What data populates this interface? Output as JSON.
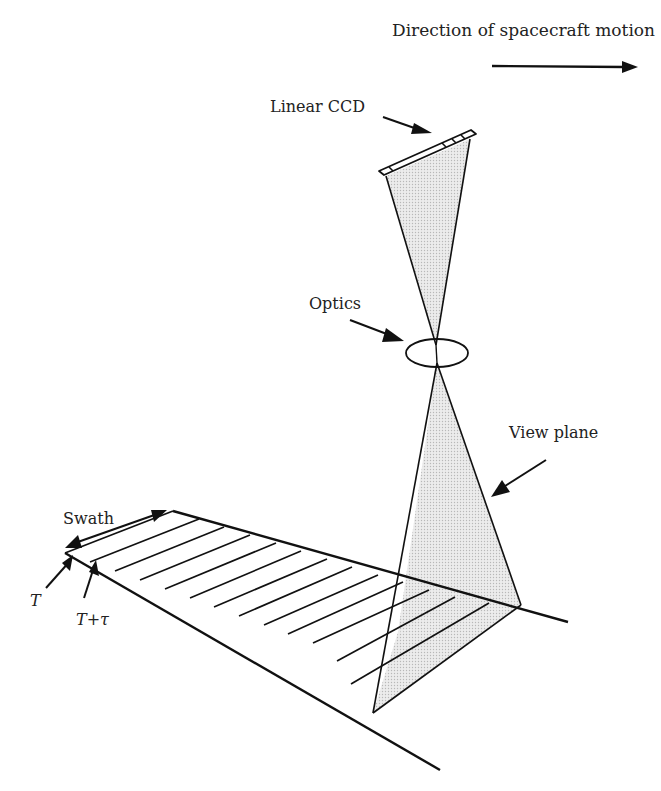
{
  "diagram": {
    "labels": {
      "direction": "Direction of spacecraft motion",
      "ccd": "Linear CCD",
      "optics": "Optics",
      "view_plane": "View plane",
      "swath": "Swath",
      "t": "T",
      "t_tau": "T+τ"
    },
    "colors": {
      "stroke": "#111111",
      "shade": "#e4e4e4",
      "text": "#222222",
      "background": "#ffffff"
    },
    "elements": [
      {
        "name": "direction-arrow",
        "from": [
          492,
          65
        ],
        "to": [
          635,
          67
        ]
      },
      {
        "name": "linear-ccd",
        "from": [
          381,
          172
        ],
        "to": [
          472,
          132
        ]
      },
      {
        "name": "optics-lens",
        "center": [
          437,
          353
        ],
        "rx": 31,
        "ry": 14
      },
      {
        "name": "upper-view-cone",
        "apex": [
          435,
          345
        ],
        "base": [
          [
            385,
            176
          ],
          [
            470,
            138
          ]
        ]
      },
      {
        "name": "lower-view-plane",
        "apex": [
          437,
          363
        ],
        "base": [
          [
            398,
            632
          ],
          [
            521,
            605
          ]
        ]
      },
      {
        "name": "ground-swath",
        "corners": [
          [
            65,
            553
          ],
          [
            173,
            511
          ],
          [
            524,
            605
          ],
          [
            373,
            713
          ]
        ]
      }
    ],
    "scan_lines_count": 14
  }
}
